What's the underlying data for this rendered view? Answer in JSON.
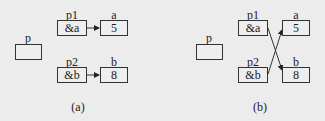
{
  "panels": [
    {
      "caption": "(a)",
      "p": {
        "name": "p",
        "value": ""
      },
      "p1": {
        "name": "p1",
        "value": "&a"
      },
      "p2": {
        "name": "p2",
        "value": "&b"
      },
      "a": {
        "name": "a",
        "value": "5"
      },
      "b": {
        "name": "b",
        "value": "8"
      },
      "arrows": "p1->a, p2->b"
    },
    {
      "caption": "(b)",
      "p": {
        "name": "p",
        "value": ""
      },
      "p1": {
        "name": "p1",
        "value": "&a"
      },
      "p2": {
        "name": "p2",
        "value": "&b"
      },
      "a": {
        "name": "a",
        "value": "5"
      },
      "b": {
        "name": "b",
        "value": "8"
      },
      "arrows": "p1->b, p2->a"
    }
  ]
}
